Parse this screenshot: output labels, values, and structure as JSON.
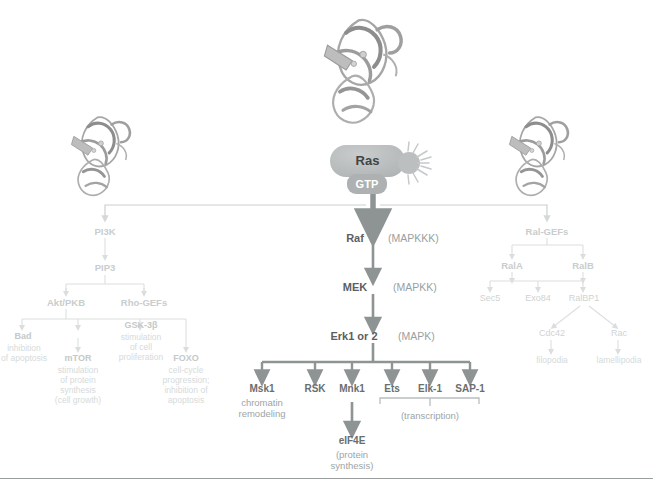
{
  "figure": {
    "background_color": "#ffffff",
    "arrow_color_main": "#8e9394",
    "arrow_color_faint": "#d9dcdc",
    "node_fill": "#b9bcbc",
    "node_text_color": "#3f4445"
  },
  "ras_node": {
    "label": "Ras",
    "nucleotide_label": "GTP",
    "starburst": "activation-burst"
  },
  "structures": [
    {
      "name": "ras-structure-center",
      "caption": ""
    },
    {
      "name": "pi3k-structure-left",
      "caption": ""
    },
    {
      "name": "ralgef-structure-right",
      "caption": ""
    }
  ],
  "mapk_cascade": [
    {
      "label": "Raf",
      "annotation": "(MAPKKK)"
    },
    {
      "label": "MEK",
      "annotation": "(MAPKK)"
    },
    {
      "label": "Erk1 or 2",
      "annotation": "(MAPK)"
    }
  ],
  "erk_effectors": [
    {
      "label": "Msk1",
      "sub": "chromatin\nremodeling"
    },
    {
      "label": "RSK",
      "sub": ""
    },
    {
      "label": "Mnk1",
      "sub": ""
    },
    {
      "label": "Ets",
      "sub": ""
    },
    {
      "label": "Elk-1",
      "sub": ""
    },
    {
      "label": "SAP-1",
      "sub": ""
    }
  ],
  "transcription_group": {
    "label": "(transcription)",
    "members": [
      "Ets",
      "Elk-1",
      "SAP-1"
    ]
  },
  "eif4e": {
    "label": "eIF4E",
    "sub": "(protein\nsynthesis)"
  },
  "pi3k_branch": {
    "root": "PI3K",
    "second": "PIP3",
    "effectors": [
      "Akt/PKB",
      "Rho-GEFs"
    ],
    "outcomes": [
      {
        "label": "Bad",
        "sub": "inhibition\nof apoptosis"
      },
      {
        "label": "mTOR",
        "sub": "stimulation\nof protein\nsynthesis\n(cell growth)"
      },
      {
        "label": "GSK-3β",
        "sub": "stimulation\nof cell\nproliferation"
      },
      {
        "label": "FOXO",
        "sub": "cell-cycle\nprogression;\ninhibition of\napoptosis"
      }
    ]
  },
  "ralgef_branch": {
    "root": "Ral-GEFs",
    "ral_proteins": [
      "RalA",
      "RalB"
    ],
    "effectors": [
      "Sec5",
      "Exo84",
      "RalBP1"
    ],
    "gtpases": [
      "Cdc42",
      "Rac"
    ],
    "outcomes": [
      "filopodia",
      "lamellipodia"
    ]
  }
}
